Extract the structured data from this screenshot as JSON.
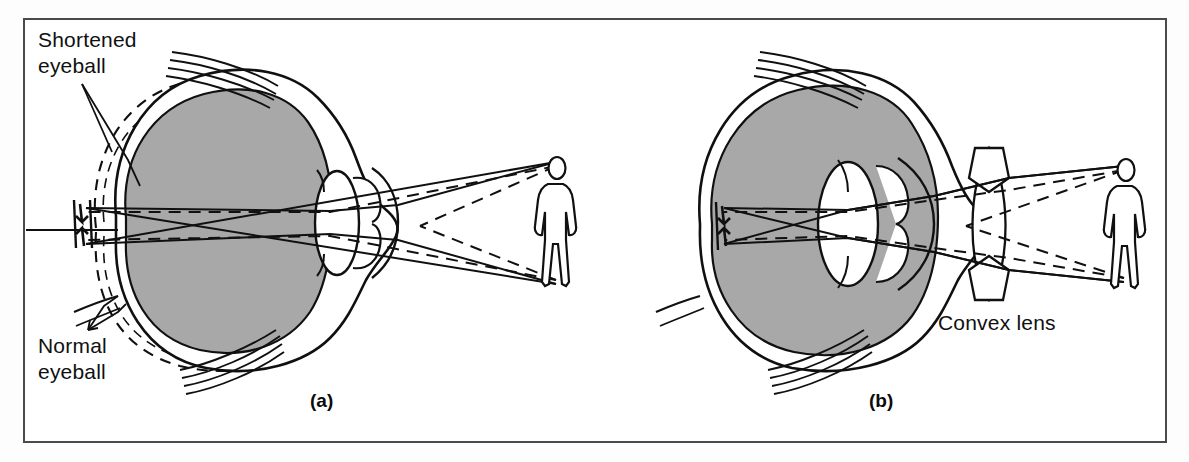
{
  "figure": {
    "background_color": "#ffffff",
    "frame_color": "#4a4a4a",
    "ink_color": "#101010",
    "vitreous_fill_color": "#a8a8a8"
  },
  "labels": {
    "shortened_eyeball": "Shortened\neyeball",
    "normal_eyeball": "Normal\neyeball",
    "convex_lens": "Convex lens"
  },
  "panels": [
    {
      "id": "a",
      "label": "(a)",
      "caption": "Shortened eyeball: light from the distant object converges behind the retina",
      "eye_shape": "shortened",
      "has_corrective_lens": false,
      "object": "person",
      "ray_styles": [
        "solid",
        "dashed"
      ]
    },
    {
      "id": "b",
      "label": "(b)",
      "caption": "Convex lens placed in front of the eye brings the image to focus on the retina",
      "eye_shape": "normal",
      "has_corrective_lens": true,
      "corrective_lens_type": "convex",
      "object": "person",
      "ray_styles": [
        "solid",
        "dashed"
      ]
    }
  ],
  "anatomy": [
    {
      "name": "sclera",
      "description": "outer white coat of the eyeball"
    },
    {
      "name": "vitreous-body",
      "description": "shaded interior of the eyeball"
    },
    {
      "name": "crystalline-lens",
      "description": "lens inside the eye"
    },
    {
      "name": "cornea",
      "description": "transparent front dome"
    },
    {
      "name": "iris",
      "description": "ciliary/iris leaflets flanking the lens"
    },
    {
      "name": "retina",
      "description": "inner rear surface where the image forms"
    },
    {
      "name": "optic-nerve",
      "description": "nerve leaving the rear of the eye"
    },
    {
      "name": "extraocular-muscle",
      "description": "muscle striations at top and bottom"
    }
  ],
  "icons": {
    "person_figure": "standing-person-icon",
    "inverted_image_arrow": "inverted-image-arrow-icon",
    "convex_lens_glyph": "biconvex-lens-icon"
  }
}
